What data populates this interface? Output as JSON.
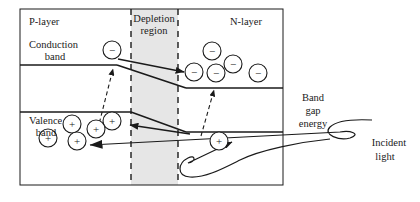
{
  "figure": {
    "stroke_color": "#1a1a1a",
    "depletion_fill": "#e6e6e6",
    "background": "#ffffff"
  },
  "labels": {
    "p_layer": "P-layer",
    "n_layer": "N-layer",
    "depletion_line1": "Depletion",
    "depletion_line2": "region",
    "conduction_line1": "Conduction",
    "conduction_line2": "band",
    "valence_line1": "Valence",
    "valence_line2": "band",
    "bandgap_line1": "Band",
    "bandgap_line2": "gap",
    "bandgap_line3": "energy",
    "incident_line1": "Incident",
    "incident_line2": "light"
  },
  "carriers": {
    "electron_sign": "−",
    "hole_sign": "+",
    "electron_radius": 9,
    "hole_radius": 9,
    "p_side_conduction_electrons": [
      {
        "cx": 112,
        "cy": 50
      }
    ],
    "n_side_conduction_electrons": [
      {
        "cx": 212,
        "cy": 51
      },
      {
        "cx": 233,
        "cy": 64
      },
      {
        "cx": 194,
        "cy": 72
      },
      {
        "cx": 216,
        "cy": 73
      },
      {
        "cx": 258,
        "cy": 73
      }
    ],
    "p_side_valence_holes": [
      {
        "cx": 112,
        "cy": 121
      },
      {
        "cx": 72,
        "cy": 124
      },
      {
        "cx": 96,
        "cy": 129
      },
      {
        "cx": 48,
        "cy": 138
      },
      {
        "cx": 77,
        "cy": 141
      }
    ],
    "n_side_valence_holes": [
      {
        "cx": 219,
        "cy": 141
      }
    ]
  },
  "geometry": {
    "outer_box": {
      "x": 20,
      "y": 9,
      "w": 263,
      "h": 176
    },
    "depletion_band": {
      "x": 131,
      "y": 9,
      "w": 47,
      "h": 176
    },
    "depletion_dash_left_x": 131,
    "depletion_dash_right_x": 178,
    "conduction_band_p_y": 65,
    "conduction_band_n_y": 88,
    "valence_band_p_y": 112,
    "valence_band_n_y": 132
  },
  "chart_data": {
    "type": "diagram",
    "regions": [
      "P-layer",
      "Depletion region",
      "N-layer"
    ],
    "bands": [
      "Conduction band",
      "Valence band"
    ],
    "annotations": [
      "Band gap energy",
      "Incident light"
    ]
  }
}
